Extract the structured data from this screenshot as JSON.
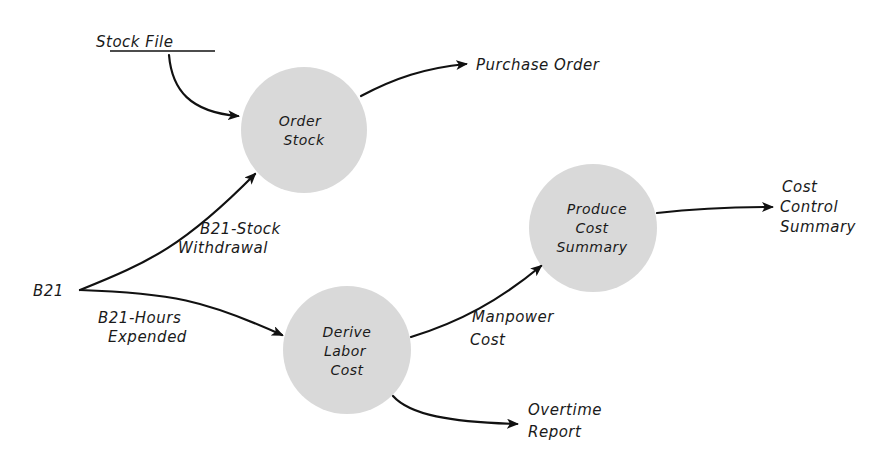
{
  "diagram": {
    "type": "data-flow-diagram",
    "colors": {
      "process_fill": "#d9d9d9",
      "line": "#111111",
      "text": "#1a1a1a",
      "background": "#ffffff"
    },
    "data_store": {
      "label": "Stock File"
    },
    "external_entity": {
      "label": "B21"
    },
    "processes": [
      {
        "id": "order-stock",
        "lines": [
          "Order",
          "Stock"
        ]
      },
      {
        "id": "derive-labor-cost",
        "lines": [
          "Derive",
          "Labor",
          "Cost"
        ]
      },
      {
        "id": "produce-cost-summary",
        "lines": [
          "Produce",
          "Cost",
          "Summary"
        ]
      }
    ],
    "flows": [
      {
        "id": "stock-file-to-order",
        "from": "Stock File",
        "to": "Order Stock",
        "lines": []
      },
      {
        "id": "purchase-order",
        "from": "Order Stock",
        "to": "output",
        "lines": [
          "Purchase Order"
        ]
      },
      {
        "id": "stock-withdrawal",
        "from": "B21",
        "to": "Order Stock",
        "lines": [
          "B21-Stock",
          "Withdrawal"
        ]
      },
      {
        "id": "hours-expended",
        "from": "B21",
        "to": "Derive Labor Cost",
        "lines": [
          "B21-Hours",
          "Expended"
        ]
      },
      {
        "id": "manpower-cost",
        "from": "Derive Labor Cost",
        "to": "Produce Cost Summary",
        "lines": [
          "Manpower",
          "Cost"
        ]
      },
      {
        "id": "overtime-report",
        "from": "Derive Labor Cost",
        "to": "output",
        "lines": [
          "Overtime",
          "Report"
        ]
      },
      {
        "id": "cost-control-summary",
        "from": "Produce Cost Summary",
        "to": "output",
        "lines": [
          "Cost",
          "Control",
          "Summary"
        ]
      }
    ]
  }
}
